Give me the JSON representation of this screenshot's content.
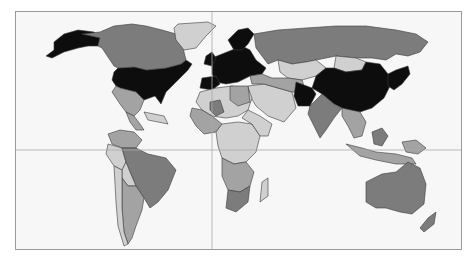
{
  "map": {
    "type": "choropleth-world",
    "grayscale": true,
    "colors": {
      "ocean": "#f7f7f7",
      "frame_border": "#9a9a9a",
      "grid_line": "#a8a8a8",
      "border_stroke": "#3a3a3a",
      "category_1": "#0d0d0d",
      "category_2": "#7c7c7c",
      "category_3": "#a3a3a3",
      "category_4": "#d0d0d0"
    },
    "grid": {
      "vertical_x": 196,
      "horizontal_y": 138
    },
    "regions": [
      {
        "name": "usa",
        "category": "category_1",
        "points": "118,55 127,55 130,58 150,56 165,52 170,48 176,52 172,58 160,70 150,80 145,92 139,84 128,88 120,80 112,78 104,76 100,74 96,68 98,60 102,56"
      },
      {
        "name": "alaska",
        "category": "category_1",
        "points": "38,30 48,22 62,18 78,20 84,26 82,34 72,34 62,36 48,40 36,46 30,44 38,38"
      },
      {
        "name": "canada",
        "category": "category_2",
        "points": "66,22 84,20 98,14 116,12 130,14 146,18 160,22 166,30 168,40 170,48 165,52 150,56 130,58 118,55 102,56 98,54 86,36 82,34 84,26"
      },
      {
        "name": "greenland",
        "category": "category_4",
        "points": "162,12 192,10 200,14 190,24 180,36 168,38 160,28 158,16"
      },
      {
        "name": "mexico",
        "category": "category_3",
        "points": "100,74 104,76 112,78 120,80 128,88 124,98 118,104 110,100 104,92 96,80"
      },
      {
        "name": "central-america",
        "category": "category_3",
        "points": "110,100 118,104 124,112 128,118 120,118 114,110"
      },
      {
        "name": "caribbean",
        "category": "category_4",
        "points": "128,100 148,104 152,112 132,108"
      },
      {
        "name": "colombia-venezuela",
        "category": "category_3",
        "points": "92,122 104,118 118,120 126,128 120,136 106,136 96,132"
      },
      {
        "name": "peru",
        "category": "category_4",
        "points": "92,132 106,136 110,150 106,158 98,154 90,142"
      },
      {
        "name": "brazil",
        "category": "category_2",
        "points": "106,136 120,136 132,142 150,146 160,158 152,178 142,190 134,196 128,186 120,174 114,160 110,150"
      },
      {
        "name": "bolivia-paraguay",
        "category": "category_4",
        "points": "106,158 110,150 114,160 120,174 112,174 106,166"
      },
      {
        "name": "argentina",
        "category": "category_3",
        "points": "106,166 112,174 120,174 128,186 126,198 120,214 116,226 112,232 108,220 106,196"
      },
      {
        "name": "chile",
        "category": "category_4",
        "points": "98,154 106,158 106,196 108,220 112,232 108,234 102,214 100,190"
      },
      {
        "name": "western-europe",
        "category": "category_1",
        "points": "196,46 206,42 216,38 226,34 234,38 240,48 250,56 246,62 234,64 222,70 210,72 200,70 196,62"
      },
      {
        "name": "scandinavia",
        "category": "category_1",
        "points": "212,28 222,18 232,16 238,22 232,32 226,38 218,38"
      },
      {
        "name": "uk-ireland",
        "category": "category_1",
        "points": "190,44 196,40 200,46 196,54 188,52"
      },
      {
        "name": "iberia",
        "category": "category_1",
        "points": "186,66 200,64 204,72 196,78 184,76"
      },
      {
        "name": "russia",
        "category": "category_2",
        "points": "238,22 262,18 290,16 320,14 350,14 380,18 400,22 412,30 404,40 392,44 380,42 370,48 356,46 340,46 320,44 300,48 290,50 276,52 262,48 252,52 246,44 240,36"
      },
      {
        "name": "kazakhstan-central-asia",
        "category": "category_4",
        "points": "262,48 276,52 290,50 300,48 310,56 300,64 286,68 272,66 264,60"
      },
      {
        "name": "middle-east",
        "category": "category_4",
        "points": "232,74 248,72 262,76 276,80 280,96 268,110 252,104 240,94 234,84"
      },
      {
        "name": "turkey-iran",
        "category": "category_3",
        "points": "234,64 246,62 256,66 272,66 286,68 290,80 276,80 262,76 248,72 236,72"
      },
      {
        "name": "mongolia",
        "category": "category_4",
        "points": "320,44 340,46 350,50 346,58 330,60 318,56"
      },
      {
        "name": "china",
        "category": "category_1",
        "points": "300,64 310,56 318,56 330,60 346,58 350,50 364,52 372,62 374,74 368,86 356,96 344,100 330,98 318,92 306,82 296,76"
      },
      {
        "name": "pakistan-afghanistan",
        "category": "category_1",
        "points": "280,70 296,76 300,82 294,94 282,94 278,84"
      },
      {
        "name": "india",
        "category": "category_2",
        "points": "294,94 306,82 318,92 326,96 318,106 310,118 304,126 298,114 292,102"
      },
      {
        "name": "southeast-asia",
        "category": "category_3",
        "points": "326,96 344,100 350,110 346,124 338,126 332,114 326,104"
      },
      {
        "name": "japan-korea",
        "category": "category_1",
        "points": "372,62 380,58 392,54 394,62 386,72 378,78 372,74"
      },
      {
        "name": "indonesia",
        "category": "category_3",
        "points": "330,132 346,136 360,140 380,142 396,146 400,152 380,152 360,148 344,144"
      },
      {
        "name": "borneo",
        "category": "category_2",
        "points": "356,120 366,116 372,124 366,134 358,132"
      },
      {
        "name": "papua",
        "category": "category_3",
        "points": "386,130 400,128 410,136 402,142 390,140"
      },
      {
        "name": "australia",
        "category": "category_2",
        "points": "350,170 366,162 380,160 392,150 404,156 410,172 408,192 396,202 384,200 370,196 360,196 350,190"
      },
      {
        "name": "new-zealand",
        "category": "category_2",
        "points": "412,206 420,200 418,212 408,220 404,216"
      },
      {
        "name": "north-africa",
        "category": "category_4",
        "points": "184,80 200,76 216,74 232,76 236,86 232,98 222,104 210,106 196,104 186,98 180,90"
      },
      {
        "name": "west-africa",
        "category": "category_3",
        "points": "176,96 186,98 196,104 206,112 200,120 188,122 180,114 174,104"
      },
      {
        "name": "sahel-mali",
        "category": "category_2",
        "points": "194,90 204,88 208,100 200,104 194,98"
      },
      {
        "name": "central-africa",
        "category": "category_4",
        "points": "200,120 206,112 222,110 236,112 244,124 240,140 230,150 218,152 206,146 202,134"
      },
      {
        "name": "east-africa",
        "category": "category_4",
        "points": "232,98 244,104 256,112 252,124 244,124 236,112 226,106"
      },
      {
        "name": "southern-africa",
        "category": "category_3",
        "points": "206,146 218,152 230,150 238,160 234,174 224,180 212,178 206,164"
      },
      {
        "name": "south-africa",
        "category": "category_2",
        "points": "212,178 224,180 234,174 232,190 220,200 210,196"
      },
      {
        "name": "madagascar",
        "category": "category_4",
        "points": "246,170 252,166 252,184 244,190"
      },
      {
        "name": "egypt-libya",
        "category": "category_3",
        "points": "214,74 232,74 234,90 222,94 214,88"
      }
    ]
  }
}
